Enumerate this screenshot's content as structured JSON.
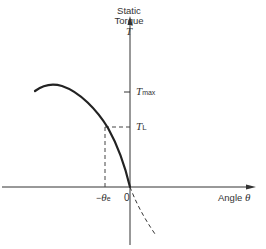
{
  "diagram": {
    "y_axis": {
      "label_line1": "Static",
      "label_line2": "Torque",
      "label_symbol": "T"
    },
    "x_axis": {
      "label": "Angle",
      "symbol": "θ"
    },
    "ticks": {
      "t_max": {
        "symbol": "T",
        "subscript": "max"
      },
      "t_l": {
        "symbol": "T",
        "subscript": "L"
      },
      "origin": "0",
      "theta_e": {
        "prefix": "−",
        "symbol": "θ",
        "subscript": "e"
      }
    },
    "colors": {
      "line": "#222222",
      "dashed": "#444444"
    }
  }
}
